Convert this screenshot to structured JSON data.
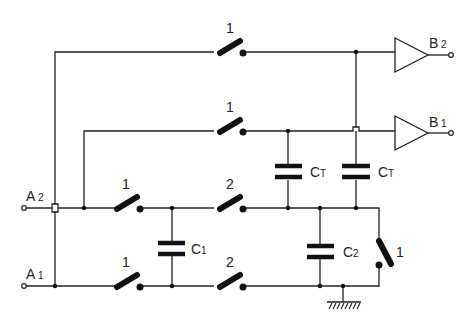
{
  "diagram": {
    "type": "switched-capacitor circuit",
    "inputs": [
      {
        "id": "A2",
        "label": "A",
        "sub": "2"
      },
      {
        "id": "A1",
        "label": "A",
        "sub": "1"
      }
    ],
    "outputs": [
      {
        "id": "B2",
        "label": "B",
        "sub": "2"
      },
      {
        "id": "B1",
        "label": "B",
        "sub": "1"
      }
    ],
    "switches": {
      "top_b2": "1",
      "top_b1": "1",
      "a2_phase1": "1",
      "a2_phase2": "2",
      "a1_phase1": "1",
      "a1_phase2": "2",
      "right_vertical": "1"
    },
    "capacitors": {
      "ct_left": {
        "label": "C",
        "sub": "T"
      },
      "ct_right": {
        "label": "C",
        "sub": "T"
      },
      "c1": {
        "label": "C",
        "sub": "1"
      },
      "c2": {
        "label": "C",
        "sub": "2"
      }
    },
    "ground": "ground-symbol"
  }
}
